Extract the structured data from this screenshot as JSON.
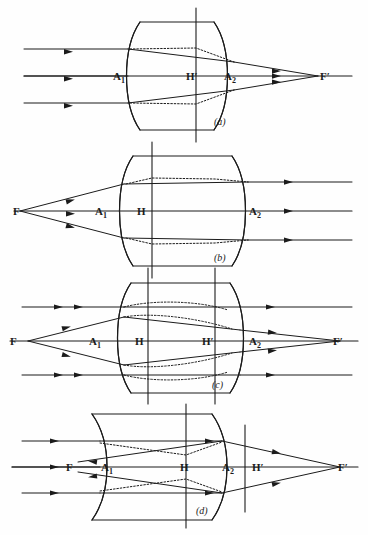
{
  "figure": {
    "background_color": "#fefefe",
    "ink_color": "#1b1b1b",
    "width": 368,
    "height": 535
  },
  "panels": [
    {
      "id": "a",
      "tag": "(a)",
      "caption": "(a)",
      "description": "Biconvex thick lens: parallel rays from the left converge to the rear focal point F' on the right; rear principal plane H' lies inside the lens.",
      "lens_type": "biconvex",
      "ray_direction": "left-to-right",
      "labels": [
        {
          "name": "A1",
          "text": "A",
          "sub": "1",
          "x": 118,
          "y": 76
        },
        {
          "name": "H-prime",
          "text": "H",
          "prime": true,
          "x": 191,
          "y": 76
        },
        {
          "name": "A2",
          "text": "A",
          "sub": "2",
          "x": 229,
          "y": 76
        },
        {
          "name": "F-prime",
          "text": "F",
          "prime": true,
          "x": 325,
          "y": 76
        }
      ],
      "principal_planes": [
        "H'"
      ],
      "focal_points": [
        "F'"
      ],
      "vertices": [
        "A1",
        "A2"
      ]
    },
    {
      "id": "b",
      "tag": "(b)",
      "caption": "(b)",
      "description": "Biconvex thick lens: rays diverging from the front focal point F on the left emerge parallel to the axis on the right; front principal plane H lies inside the lens.",
      "lens_type": "biconvex",
      "ray_direction": "left-to-right",
      "labels": [
        {
          "name": "F",
          "text": "F",
          "x": 17,
          "y": 211
        },
        {
          "name": "A1",
          "text": "A",
          "sub": "1",
          "x": 100,
          "y": 211
        },
        {
          "name": "H",
          "text": "H",
          "x": 141,
          "y": 211
        },
        {
          "name": "A2",
          "text": "A",
          "sub": "2",
          "x": 254,
          "y": 211
        }
      ],
      "principal_planes": [
        "H"
      ],
      "focal_points": [
        "F"
      ],
      "vertices": [
        "A1",
        "A2"
      ]
    },
    {
      "id": "c",
      "tag": "(c)",
      "caption": "(c)",
      "description": "Biconvex thick lens showing both principal planes H and H' together with both focal points F and F'; parallel rays and rays from F are drawn simultaneously.",
      "lens_type": "biconvex",
      "ray_direction": "both",
      "labels": [
        {
          "name": "F",
          "text": "F",
          "x": 14,
          "y": 341
        },
        {
          "name": "A1",
          "text": "A",
          "sub": "1",
          "x": 94,
          "y": 341
        },
        {
          "name": "H",
          "text": "H",
          "x": 140,
          "y": 341
        },
        {
          "name": "H-prime",
          "text": "H",
          "prime": true,
          "x": 207,
          "y": 341
        },
        {
          "name": "A2",
          "text": "A",
          "sub": "2",
          "x": 254,
          "y": 341
        },
        {
          "name": "F-prime",
          "text": "F",
          "prime": true,
          "x": 337,
          "y": 341
        }
      ],
      "principal_planes": [
        "H",
        "H'"
      ],
      "focal_points": [
        "F",
        "F'"
      ],
      "vertices": [
        "A1",
        "A2"
      ]
    },
    {
      "id": "d",
      "tag": "(d)",
      "caption": "(d)",
      "description": "Thick meniscus lens: the principal planes are crossed — H lies inside while H' lies outside to the right of vertex A2; F is to the left and F' far to the right.",
      "lens_type": "meniscus",
      "ray_direction": "both",
      "labels": [
        {
          "name": "F",
          "text": "F",
          "x": 71,
          "y": 467
        },
        {
          "name": "A1",
          "text": "A",
          "sub": "1",
          "x": 108,
          "y": 467
        },
        {
          "name": "H",
          "text": "H",
          "x": 185,
          "y": 467
        },
        {
          "name": "A2",
          "text": "A",
          "sub": "2",
          "x": 229,
          "y": 467
        },
        {
          "name": "H-prime",
          "text": "H",
          "prime": true,
          "x": 259,
          "y": 467
        },
        {
          "name": "F-prime",
          "text": "F",
          "prime": true,
          "x": 345,
          "y": 467
        }
      ],
      "principal_planes": [
        "H",
        "H'"
      ],
      "focal_points": [
        "F",
        "F'"
      ],
      "vertices": [
        "A1",
        "A2"
      ]
    }
  ],
  "legend": {
    "solid_ray": "idealized ray path (solid)",
    "dotted_ray": "actual refracted ray path inside the glass (dotted)",
    "axis": "optical axis (horizontal line)",
    "vertical_line": "principal plane (vertical line)"
  }
}
